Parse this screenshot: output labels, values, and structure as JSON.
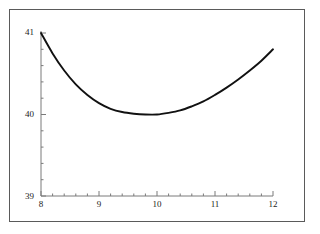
{
  "figure": {
    "background_color": "#ffffff",
    "frame_color": "#5a5a5a",
    "axis_color": "#7a7a7a",
    "curve_color": "#111111"
  },
  "chart_data": {
    "type": "line",
    "title": "",
    "subtitle": "",
    "xlabel": "",
    "ylabel": "",
    "xlim": [
      8,
      12
    ],
    "ylim": [
      39,
      41
    ],
    "grid": false,
    "legend": null,
    "x_ticks": [
      8,
      9,
      10,
      11,
      12
    ],
    "x_tick_labels": [
      "8",
      "9",
      "10",
      "11",
      "12"
    ],
    "y_ticks": [
      39,
      40,
      41
    ],
    "y_tick_labels": [
      "39",
      "40",
      "41"
    ],
    "x_minor_tick_count": 4,
    "y_minor_tick_count": 4,
    "series": [
      {
        "name": "curve",
        "x": [
          8.0,
          8.2,
          8.4,
          8.6,
          8.8,
          9.0,
          9.2,
          9.4,
          9.6,
          9.8,
          10.0,
          10.2,
          10.4,
          10.6,
          10.8,
          11.0,
          11.2,
          11.4,
          11.6,
          11.8,
          12.0
        ],
        "y": [
          41.0,
          40.75,
          40.54,
          40.37,
          40.24,
          40.14,
          40.07,
          40.03,
          40.01,
          40.0,
          40.0,
          40.02,
          40.05,
          40.1,
          40.16,
          40.24,
          40.33,
          40.43,
          40.54,
          40.66,
          40.8
        ]
      }
    ]
  }
}
